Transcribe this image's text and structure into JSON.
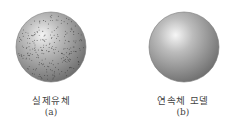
{
  "figures": [
    {
      "label": "실제유체",
      "sublabel": "(a)",
      "style": "particulate sphere"
    },
    {
      "label": "연속체 모델",
      "sublabel": "(b)",
      "style": "smooth sphere"
    }
  ],
  "colors": {
    "sphere_light": "#e8e8e8",
    "sphere_dark": "#7a7a7a",
    "dots": "#333333"
  }
}
